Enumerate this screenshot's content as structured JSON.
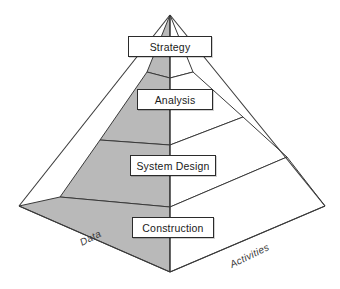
{
  "diagram": {
    "type": "layered-pyramid",
    "title": "",
    "tiers": [
      {
        "id": "strategy",
        "label": "Strategy",
        "order": 1
      },
      {
        "id": "analysis",
        "label": "Analysis",
        "order": 2
      },
      {
        "id": "system-design",
        "label": "System Design",
        "order": 3
      },
      {
        "id": "construction",
        "label": "Construction",
        "order": 4
      }
    ],
    "faces": [
      {
        "id": "left-face",
        "label": "Data",
        "fill": "#b9b9b9"
      },
      {
        "id": "right-face",
        "label": "Activities",
        "fill": "#ffffff"
      }
    ],
    "colors": {
      "left_face_fill": "#b9b9b9",
      "right_face_fill": "#ffffff",
      "outline": "#3a3a3a",
      "box_fill": "#ffffff",
      "box_border": "#2b2b2b",
      "text": "#1a1a1a",
      "side_label_text": "#3a3a3a",
      "background": "#ffffff"
    }
  }
}
